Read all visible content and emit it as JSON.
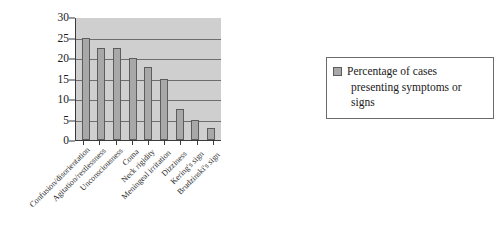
{
  "chart_data": {
    "type": "bar",
    "title": "",
    "xlabel": "",
    "ylabel": "",
    "ylim": [
      0,
      30
    ],
    "ytick_step": 5,
    "yticks": [
      "0",
      "5",
      "10",
      "15",
      "20",
      "25",
      "30"
    ],
    "grid": true,
    "legend_position": "right",
    "categories": [
      "Confusion/disorientation",
      "Agitation/restlessness",
      "Unconsciousness",
      "Coma",
      "Neck rigidity",
      "Meningeal irritation",
      "Dizziness",
      "Kering's sign",
      "Brudzinski's sign"
    ],
    "series": [
      {
        "name": "Percentage of cases presenting symptoms or signs",
        "values": [
          25,
          22.5,
          22.5,
          20,
          17.7,
          15,
          7.5,
          5,
          3
        ]
      }
    ]
  },
  "legend": {
    "line1": "Percentage of cases",
    "line2": "presenting symptoms or signs",
    "swatch_color": "#a8a8a8"
  },
  "style": {
    "plot_background": "#cfcfcf",
    "bar_fill": "#a8a8a8",
    "bar_stroke": "#5c5c5c",
    "gridline_color": "#6e6e6e",
    "axis_color": "#3a3a3a"
  }
}
